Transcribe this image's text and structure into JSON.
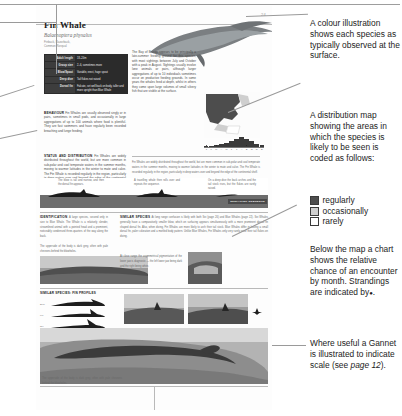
{
  "page": {
    "number": "24",
    "title": "Fin Whale",
    "latin_name": "Balaenoptera physalus",
    "other_names_line1": "Finback, Razorback,",
    "other_names_line2": "Common Rorqual"
  },
  "facts": {
    "rows": [
      {
        "key": "Adult length",
        "value": "18–24m"
      },
      {
        "key": "Group size",
        "value": "2–6, sometimes more"
      },
      {
        "key": "Blow/Spout",
        "value": "Variable, erect, huge spout"
      },
      {
        "key": "Deep dive",
        "value": "Tail flukes not raised"
      },
      {
        "key": "Dorsal fin",
        "value": "Falcate, set well back on body, taller and more upright than Blue Whale"
      }
    ]
  },
  "sections": {
    "behaviour_head": "BEHAVIOUR",
    "behaviour_text": "Fin Whales are usually observed singly or in pairs, sometimes in small pods, and occasionally in large aggregations of up to 100 animals where food is plentiful. They are fast swimmers and have regularly been recorded breaching and lunge feeding.",
    "status_head": "STATUS AND DISTRIBUTION",
    "status_text": "Fin Whales are widely distributed throughout the world, but are more common in sub-polar and cool temperate waters in the summer months, moving to warmer latitudes in the winter to mate and calve. The Fin Whale is recorded regularly in the region, particularly in deep waters over and beyond the edge of the continental shelf.",
    "right_col_text": "The Bay of Biscay appears to be principally a late-summer feeding ground for this species, with most sightings between July and October with a peak in August. Sightings usually involve lone animals or pairs, although larger aggregations of up to 10 individuals sometimes occur on productive feeding grounds. In some years the whales feed at depth, whilst in others they come upon large volumes of small silvery fish that are visible at the surface.",
    "identification_head": "IDENTIFICATION",
    "identification_text": "A large species, second only in size to Blue Whale. The Whale is a relatively slender, streamlined animal with a pointed head and a prominent, noticeably condensed three-quarters of the way along the back.",
    "identification_caption": "The upperside of the body is dark grey, often with pale chevrons behind the blowholes.",
    "similar_head": "SIMILAR SPECIES",
    "similar_text": "At long range confusion is likely with both Sei (page 26) and Blue Whales (page 22). Sei Whales generally have a comparatively smaller blow, which on surfacing appears simultaneously with a more prominent dorsal fin shaped dorsal fin. Also, when diving, Fin Whales are more likely to arch their tail stock. Blue Whales differ in having a small dorsal fin, paler coloration and a mottled body pattern. Unlike Blue Whales, Fin Whales only very rarely raise their tail flukes on diving.",
    "similar_caption": "At close range the asymmetrical pigmentation of the lower jaw is diagnostic — the left lower jaw being dark and the right being white.",
    "fin_profiles_head": "SIMILAR SPECIES: FIN PROFILES",
    "surfacing_tag": "SURFACING SEQUENCE",
    "surfacing_notes": [
      "The blow is tall and narrow, and then the dorsal fin appears.",
      "A travelling whale then rolls over and repeats the sequence.",
      "On a deep dive the back arches and the tail stock rises, but the flukes are rarely raised."
    ],
    "fin_profile_labels": [
      "Blue",
      "Fin",
      "Sei",
      "Minke"
    ]
  },
  "chart_data": {
    "type": "bar",
    "title": "Relative chance of an encounter by month",
    "categories": [
      "J",
      "F",
      "M",
      "A",
      "M",
      "J",
      "J",
      "A",
      "S",
      "O",
      "N",
      "D"
    ],
    "values": [
      1,
      1,
      2,
      3,
      4,
      6,
      8,
      10,
      8,
      6,
      3,
      2
    ],
    "ylim": [
      0,
      10
    ],
    "xlabel": "",
    "ylabel": "",
    "strandings_marker": "dot",
    "strandings_months": [
      "M",
      "J",
      "S"
    ]
  },
  "map_legend": {
    "items": [
      {
        "label": "regularly",
        "color": "#4d4d4d"
      },
      {
        "label": "occasionally",
        "color": "#cfcfcf"
      },
      {
        "label": "rarely",
        "color": "#ffffff"
      }
    ]
  },
  "notes": {
    "illustration": "A colour illustration shows each species as typically observed at the surface.",
    "map_intro": "A distribution map showing the areas in which the species is likely to be seen is coded as follows:",
    "chart": "Below the map a chart shows the relative chance of an encounter by month.  Strandings are indicated by",
    "chart_marker": "●",
    "chart_end": ".",
    "gannet_part1": "Where useful a Gannet is illustrated to indicate scale (see ",
    "gannet_ref": "page 12",
    "gannet_part2": ")."
  }
}
